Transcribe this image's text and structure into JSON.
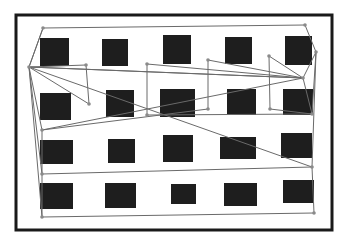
{
  "figure": {
    "width": 344,
    "height": 242,
    "background": "#ffffff",
    "frame": {
      "x": 16,
      "y": 15,
      "w": 316,
      "h": 215,
      "stroke": "#1a1a1a",
      "stroke_width": 3
    },
    "square_color": "#1e1e1e",
    "path_color": "#6a6a6a",
    "node_color": "#8a8a8a",
    "squares": [
      {
        "x": 40,
        "y": 38,
        "w": 29,
        "h": 28
      },
      {
        "x": 102,
        "y": 39,
        "w": 26,
        "h": 27
      },
      {
        "x": 163,
        "y": 35,
        "w": 28,
        "h": 29
      },
      {
        "x": 225,
        "y": 37,
        "w": 27,
        "h": 27
      },
      {
        "x": 285,
        "y": 36,
        "w": 27,
        "h": 29
      },
      {
        "x": 40,
        "y": 93,
        "w": 31,
        "h": 27
      },
      {
        "x": 106,
        "y": 90,
        "w": 28,
        "h": 27
      },
      {
        "x": 160,
        "y": 89,
        "w": 35,
        "h": 28
      },
      {
        "x": 227,
        "y": 89,
        "w": 29,
        "h": 26
      },
      {
        "x": 283,
        "y": 89,
        "w": 30,
        "h": 26
      },
      {
        "x": 40,
        "y": 140,
        "w": 33,
        "h": 24
      },
      {
        "x": 108,
        "y": 139,
        "w": 27,
        "h": 24
      },
      {
        "x": 163,
        "y": 135,
        "w": 30,
        "h": 27
      },
      {
        "x": 220,
        "y": 137,
        "w": 36,
        "h": 22
      },
      {
        "x": 281,
        "y": 133,
        "w": 31,
        "h": 25
      },
      {
        "x": 40,
        "y": 183,
        "w": 33,
        "h": 26
      },
      {
        "x": 105,
        "y": 183,
        "w": 31,
        "h": 25
      },
      {
        "x": 171,
        "y": 184,
        "w": 25,
        "h": 20
      },
      {
        "x": 224,
        "y": 183,
        "w": 33,
        "h": 23
      },
      {
        "x": 283,
        "y": 180,
        "w": 31,
        "h": 23
      }
    ],
    "nodes": [
      {
        "x": 43,
        "y": 28
      },
      {
        "x": 305,
        "y": 25
      },
      {
        "x": 316,
        "y": 52
      },
      {
        "x": 29,
        "y": 67
      },
      {
        "x": 86,
        "y": 65
      },
      {
        "x": 147,
        "y": 64
      },
      {
        "x": 208,
        "y": 60
      },
      {
        "x": 269,
        "y": 56
      },
      {
        "x": 303,
        "y": 78
      },
      {
        "x": 89,
        "y": 104
      },
      {
        "x": 147,
        "y": 115
      },
      {
        "x": 208,
        "y": 109
      },
      {
        "x": 270,
        "y": 109
      },
      {
        "x": 312,
        "y": 114
      },
      {
        "x": 42,
        "y": 130
      },
      {
        "x": 42,
        "y": 174
      },
      {
        "x": 312,
        "y": 167
      },
      {
        "x": 42,
        "y": 217
      },
      {
        "x": 314,
        "y": 213
      }
    ],
    "path": [
      [
        43,
        28
      ],
      [
        305,
        25
      ],
      [
        316,
        52
      ],
      [
        303,
        78
      ],
      [
        29,
        67
      ],
      [
        86,
        65
      ],
      [
        89,
        104
      ],
      [
        29,
        67
      ],
      [
        303,
        78
      ],
      [
        147,
        64
      ],
      [
        147,
        115
      ],
      [
        312,
        114
      ],
      [
        303,
        78
      ],
      [
        269,
        56
      ],
      [
        270,
        109
      ],
      [
        312,
        114
      ],
      [
        316,
        52
      ],
      [
        312,
        167
      ],
      [
        42,
        174
      ],
      [
        29,
        67
      ],
      [
        43,
        28
      ],
      [
        29,
        67
      ],
      [
        42,
        130
      ],
      [
        303,
        78
      ],
      [
        208,
        60
      ],
      [
        208,
        109
      ],
      [
        42,
        130
      ],
      [
        42,
        217
      ],
      [
        314,
        213
      ],
      [
        312,
        167
      ],
      [
        29,
        67
      ],
      [
        42,
        217
      ]
    ]
  }
}
